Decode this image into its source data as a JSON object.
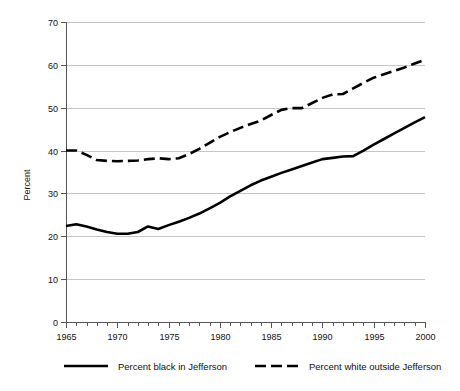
{
  "chart_data": {
    "type": "line",
    "title": "",
    "xlabel": "",
    "ylabel": "Percent",
    "xlim": [
      1965,
      2000
    ],
    "ylim": [
      0,
      70
    ],
    "ytick_step": 10,
    "xtick_step": 5,
    "minor_xtick_step": 1,
    "grid": "horizontal",
    "legend_position": "bottom",
    "x": [
      1965,
      1966,
      1967,
      1968,
      1969,
      1970,
      1971,
      1972,
      1973,
      1974,
      1975,
      1976,
      1977,
      1978,
      1979,
      1980,
      1981,
      1982,
      1983,
      1984,
      1985,
      1986,
      1987,
      1988,
      1989,
      1990,
      1991,
      1992,
      1993,
      1994,
      1995,
      1996,
      1997,
      1998,
      1999,
      2000
    ],
    "ytick_labels": [
      "0",
      "10",
      "20",
      "30",
      "40",
      "50",
      "60",
      "70"
    ],
    "xtick_labels": [
      "1965",
      "1970",
      "1975",
      "1980",
      "1985",
      "1990",
      "1995",
      "2000"
    ],
    "series": [
      {
        "name": "Percent black in Jefferson",
        "style": "solid",
        "color": "#000000",
        "values": [
          22.4,
          22.8,
          22.3,
          21.6,
          21.0,
          20.6,
          20.6,
          21.0,
          22.3,
          21.7,
          22.6,
          23.4,
          24.3,
          25.3,
          26.5,
          27.8,
          29.3,
          30.6,
          31.9,
          33.0,
          33.9,
          34.8,
          35.6,
          36.4,
          37.2,
          38.0,
          38.3,
          38.6,
          38.7,
          40.0,
          41.4,
          42.7,
          44.0,
          45.3,
          46.6,
          47.8
        ]
      },
      {
        "name": "Percent white outside Jefferson",
        "style": "dashed",
        "color": "#000000",
        "values": [
          40.0,
          40.0,
          39.0,
          37.8,
          37.6,
          37.5,
          37.6,
          37.7,
          38.0,
          38.2,
          38.0,
          38.2,
          39.2,
          40.4,
          41.8,
          43.2,
          44.3,
          45.3,
          46.2,
          47.0,
          48.3,
          49.5,
          49.9,
          49.9,
          51.1,
          52.3,
          53.1,
          53.2,
          54.5,
          55.8,
          57.0,
          57.8,
          58.6,
          59.4,
          60.3,
          61.2
        ]
      }
    ]
  },
  "legend": {
    "items": [
      {
        "label": "Percent black in Jefferson",
        "style": "solid"
      },
      {
        "label": "Percent white outside Jefferson",
        "style": "dashed"
      }
    ]
  },
  "colors": {
    "series": "#000000",
    "grid": "#b8b8b8",
    "axis": "#555555",
    "background": "#ffffff"
  }
}
